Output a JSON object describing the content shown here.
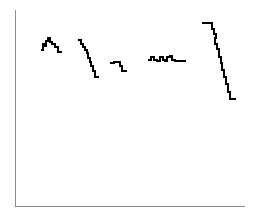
{
  "figure": {
    "width": 254,
    "height": 217,
    "background_color": "#ffffff",
    "title": "",
    "subtitle": ""
  },
  "axes": {
    "color": "#8c8c8c",
    "line_width": 1,
    "x_axis": {
      "name": "x-axis",
      "x1": 15,
      "y1": 206,
      "x2": 245,
      "y2": 206,
      "label": "",
      "ticks": [],
      "tick_labels": []
    },
    "y_axis": {
      "name": "y-axis",
      "x1": 15,
      "y1": 10,
      "x2": 15,
      "y2": 206,
      "label": "",
      "ticks": [],
      "tick_labels": []
    },
    "spines": {
      "left": true,
      "bottom": true,
      "top": false,
      "right": false
    },
    "grid": false,
    "legend": null
  },
  "chart_data": {
    "type": "line",
    "title": "",
    "subtitle": "",
    "xlabel": "",
    "ylabel": "",
    "xlim": [
      0,
      254
    ],
    "ylim": [
      0,
      217
    ],
    "grid": false,
    "legend": null,
    "drawstyle": "steps-post",
    "line_color": "#000000",
    "line_width": 2,
    "series": [
      {
        "name": "segment-1",
        "color": "#000000",
        "points": [
          [
            41,
            50
          ],
          [
            43,
            50
          ],
          [
            43,
            44
          ],
          [
            45,
            44
          ],
          [
            45,
            46
          ],
          [
            46,
            46
          ],
          [
            46,
            41
          ],
          [
            48,
            41
          ],
          [
            48,
            38
          ],
          [
            50,
            38
          ],
          [
            50,
            42
          ],
          [
            52,
            42
          ],
          [
            52,
            44
          ],
          [
            55,
            44
          ],
          [
            55,
            47
          ],
          [
            58,
            47
          ],
          [
            58,
            52
          ],
          [
            62,
            52
          ]
        ]
      },
      {
        "name": "segment-2",
        "color": "#000000",
        "points": [
          [
            78,
            40
          ],
          [
            81,
            40
          ],
          [
            81,
            44
          ],
          [
            83,
            44
          ],
          [
            83,
            47
          ],
          [
            85,
            47
          ],
          [
            85,
            50
          ],
          [
            87,
            50
          ],
          [
            87,
            53
          ],
          [
            88,
            53
          ],
          [
            88,
            58
          ],
          [
            90,
            58
          ],
          [
            90,
            62
          ],
          [
            91,
            62
          ],
          [
            91,
            66
          ],
          [
            93,
            66
          ],
          [
            93,
            71
          ],
          [
            95,
            71
          ],
          [
            95,
            77
          ],
          [
            99,
            77
          ]
        ]
      },
      {
        "name": "segment-3",
        "color": "#000000",
        "points": [
          [
            110,
            63
          ],
          [
            114,
            63
          ],
          [
            114,
            62
          ],
          [
            120,
            62
          ],
          [
            120,
            66
          ],
          [
            122,
            66
          ],
          [
            122,
            71
          ],
          [
            127,
            71
          ]
        ]
      },
      {
        "name": "segment-4",
        "color": "#000000",
        "points": [
          [
            148,
            60
          ],
          [
            151,
            60
          ],
          [
            151,
            57
          ],
          [
            154,
            57
          ],
          [
            154,
            60
          ],
          [
            157,
            60
          ],
          [
            157,
            61
          ],
          [
            160,
            61
          ],
          [
            160,
            57
          ],
          [
            163,
            57
          ],
          [
            163,
            60
          ],
          [
            165,
            60
          ],
          [
            165,
            61
          ],
          [
            167,
            61
          ],
          [
            167,
            57
          ],
          [
            170,
            57
          ],
          [
            170,
            56
          ],
          [
            172,
            56
          ],
          [
            172,
            60
          ],
          [
            175,
            60
          ],
          [
            175,
            61
          ],
          [
            186,
            61
          ]
        ]
      },
      {
        "name": "segment-5",
        "color": "#000000",
        "points": [
          [
            202,
            23
          ],
          [
            212,
            23
          ],
          [
            212,
            29
          ],
          [
            214,
            29
          ],
          [
            214,
            34
          ],
          [
            216,
            34
          ],
          [
            216,
            38
          ],
          [
            215,
            38
          ],
          [
            215,
            44
          ],
          [
            217,
            44
          ],
          [
            217,
            49
          ],
          [
            219,
            49
          ],
          [
            219,
            57
          ],
          [
            221,
            57
          ],
          [
            221,
            63
          ],
          [
            222,
            63
          ],
          [
            222,
            70
          ],
          [
            224,
            70
          ],
          [
            224,
            77
          ],
          [
            226,
            77
          ],
          [
            226,
            84
          ],
          [
            228,
            84
          ],
          [
            228,
            92
          ],
          [
            230,
            92
          ],
          [
            230,
            99
          ],
          [
            236,
            99
          ]
        ]
      }
    ]
  }
}
